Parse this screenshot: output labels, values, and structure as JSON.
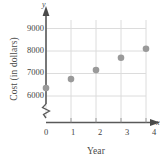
{
  "chart_data": {
    "type": "scatter",
    "title": "",
    "xlabel": "Year",
    "ylabel": "Cost (in dollars)",
    "x_axis_letter": "x",
    "y_axis_letter": "y",
    "x": [
      0,
      1,
      2,
      3,
      4
    ],
    "values": [
      6350,
      6750,
      7150,
      7700,
      8100
    ],
    "xticks": [
      "0",
      "1",
      "2",
      "3",
      "4"
    ],
    "yticks": [
      "6000",
      "7000",
      "8000",
      "9000"
    ],
    "xlim": [
      0,
      4
    ],
    "ylim": [
      6000,
      9000
    ],
    "grid": true,
    "legend": "none",
    "axis_break": "y-axis break below 6000",
    "point_color": "#9a9a9a",
    "grid_color": "#d8d8d8",
    "axis_color": "#555555"
  }
}
